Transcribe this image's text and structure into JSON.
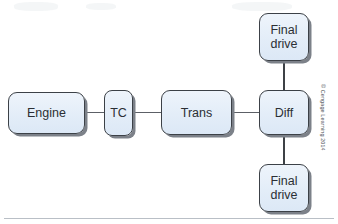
{
  "figure": {
    "type": "block-diagram",
    "background_color": "#ffffff",
    "node_fill_color": "#e3edf8",
    "node_border_color": "#3c4147",
    "connector_color": "#5c6066"
  },
  "nodes": [
    {
      "id": "engine",
      "label": "Engine"
    },
    {
      "id": "tc",
      "label": "TC"
    },
    {
      "id": "trans",
      "label": "Trans"
    },
    {
      "id": "diff",
      "label": "Diff"
    },
    {
      "id": "final_drive_top",
      "label": "Final\ndrive"
    },
    {
      "id": "final_drive_bottom",
      "label": "Final\ndrive"
    }
  ],
  "connections": [
    {
      "from": "engine",
      "to": "tc",
      "orientation": "horizontal"
    },
    {
      "from": "tc",
      "to": "trans",
      "orientation": "horizontal"
    },
    {
      "from": "trans",
      "to": "diff",
      "orientation": "horizontal"
    },
    {
      "from": "diff",
      "to": "final_drive_top",
      "orientation": "vertical"
    },
    {
      "from": "diff",
      "to": "final_drive_bottom",
      "orientation": "vertical"
    }
  ],
  "credit": {
    "text": "© Cengage Learning 2014"
  }
}
